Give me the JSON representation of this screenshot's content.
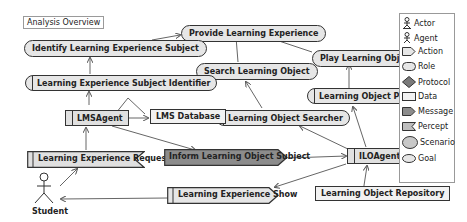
{
  "diagram": {
    "title": "Analysis Overview",
    "goals": [
      {
        "id": "provide",
        "label": "Provide Learning Experience"
      },
      {
        "id": "identify",
        "label": "Identify Learning Experience Subject"
      },
      {
        "id": "search",
        "label": "Search Learning Object"
      },
      {
        "id": "play",
        "label": "Play Learning Object"
      }
    ],
    "roles": [
      {
        "id": "lesi",
        "label": "Learning Experience Subject Identifier"
      },
      {
        "id": "los",
        "label": "Learning Object Searcher"
      },
      {
        "id": "lop",
        "label": "Learning Object Player"
      }
    ],
    "agents": [
      {
        "id": "lms",
        "label": "LMSAgent"
      },
      {
        "id": "ilo",
        "label": "ILOAgent"
      }
    ],
    "data": [
      {
        "id": "lmsdb",
        "label": "LMS Database"
      },
      {
        "id": "lor",
        "label": "Learning Object Repository"
      }
    ],
    "percepts": [
      {
        "id": "ler",
        "label": "Learning Experience Request"
      }
    ],
    "messages": [
      {
        "id": "ilos",
        "label": "Inform Learning Object Subject"
      }
    ],
    "actions": [
      {
        "id": "les",
        "label": "Learning Experience Show"
      }
    ],
    "actors": [
      {
        "id": "student",
        "label": "Student"
      }
    ]
  },
  "legend": {
    "items": [
      {
        "label": "Actor",
        "icon": "actor-icon"
      },
      {
        "label": "Agent",
        "icon": "agent-icon"
      },
      {
        "label": "Action",
        "icon": "action-icon"
      },
      {
        "label": "Role",
        "icon": "role-icon"
      },
      {
        "label": "Protocol",
        "icon": "protocol-icon"
      },
      {
        "label": "Data",
        "icon": "data-icon"
      },
      {
        "label": "Message",
        "icon": "message-icon"
      },
      {
        "label": "Percept",
        "icon": "percept-icon"
      },
      {
        "label": "Scenario",
        "icon": "scenario-icon"
      },
      {
        "label": "Goal",
        "icon": "goal-icon"
      }
    ]
  },
  "colors": {
    "node_fill": "#e6e6e6",
    "message_fill": "#8c8c8c",
    "stroke": "#333333"
  }
}
